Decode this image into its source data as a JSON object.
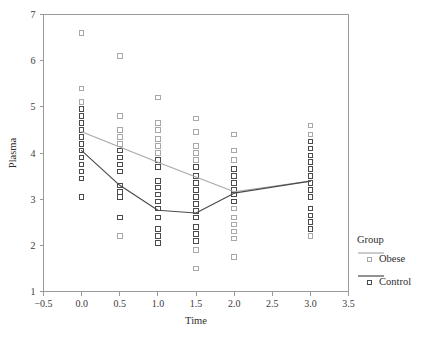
{
  "chart_data": {
    "type": "scatter",
    "title": "",
    "xlabel": "Time",
    "ylabel": "Plasma",
    "xlim": [
      -0.5,
      3.5
    ],
    "ylim": [
      1,
      7
    ],
    "xticks": [
      -0.5,
      0.0,
      0.5,
      1.0,
      1.5,
      2.0,
      2.5,
      3.0,
      3.5
    ],
    "xtick_labels": [
      "−0.5",
      "0.0",
      "0.5",
      "1.0",
      "1.5",
      "2.0",
      "2.5",
      "3.0",
      "3.5"
    ],
    "yticks": [
      1,
      2,
      3,
      4,
      5,
      6,
      7
    ],
    "ytick_labels": [
      "1",
      "2",
      "3",
      "4",
      "5",
      "6",
      "7"
    ],
    "grid": false,
    "legend": {
      "title": "Group",
      "position": "right",
      "entries": [
        {
          "name": "Obese",
          "color": "#a8a8a8",
          "marker": "open-square"
        },
        {
          "name": "Control",
          "color": "#4a4a4a",
          "marker": "open-square"
        }
      ]
    },
    "series": [
      {
        "name": "Obese",
        "type": "line",
        "color": "#a8a8a8",
        "x": [
          0.0,
          0.5,
          1.0,
          1.5,
          2.0,
          3.0
        ],
        "values": [
          4.46,
          4.13,
          3.8,
          3.48,
          3.16,
          3.39
        ]
      },
      {
        "name": "Control",
        "type": "line",
        "color": "#4a4a4a",
        "x": [
          0.0,
          0.5,
          1.0,
          1.5,
          2.0,
          3.0
        ],
        "values": [
          4.05,
          3.3,
          2.76,
          2.7,
          3.13,
          3.39
        ]
      }
    ],
    "scatter_points": {
      "Obese": {
        "color": "#a8a8a8",
        "points": [
          [
            0.0,
            6.6
          ],
          [
            0.0,
            5.4
          ],
          [
            0.0,
            5.1
          ],
          [
            0.0,
            4.95
          ],
          [
            0.0,
            4.8
          ],
          [
            0.0,
            4.65
          ],
          [
            0.0,
            4.5
          ],
          [
            0.0,
            4.35
          ],
          [
            0.0,
            4.2
          ],
          [
            0.0,
            4.05
          ],
          [
            0.0,
            3.9
          ],
          [
            0.0,
            3.75
          ],
          [
            0.0,
            3.6
          ],
          [
            0.0,
            3.45
          ],
          [
            0.0,
            3.05
          ],
          [
            0.5,
            6.1
          ],
          [
            0.5,
            4.8
          ],
          [
            0.5,
            4.5
          ],
          [
            0.5,
            4.35
          ],
          [
            0.5,
            4.2
          ],
          [
            0.5,
            4.05
          ],
          [
            0.5,
            3.9
          ],
          [
            0.5,
            3.75
          ],
          [
            0.5,
            3.6
          ],
          [
            0.5,
            3.3
          ],
          [
            0.5,
            3.15
          ],
          [
            0.5,
            3.05
          ],
          [
            0.5,
            2.6
          ],
          [
            0.5,
            2.2
          ],
          [
            1.0,
            5.2
          ],
          [
            1.0,
            4.65
          ],
          [
            1.0,
            4.5
          ],
          [
            1.0,
            4.3
          ],
          [
            1.0,
            4.15
          ],
          [
            1.0,
            4.0
          ],
          [
            1.0,
            3.85
          ],
          [
            1.0,
            3.7
          ],
          [
            1.0,
            3.4
          ],
          [
            1.0,
            3.25
          ],
          [
            1.0,
            3.1
          ],
          [
            1.0,
            2.95
          ],
          [
            1.0,
            2.8
          ],
          [
            1.0,
            2.6
          ],
          [
            1.0,
            2.35
          ],
          [
            1.0,
            2.2
          ],
          [
            1.0,
            2.05
          ],
          [
            1.5,
            4.75
          ],
          [
            1.5,
            4.45
          ],
          [
            1.5,
            4.15
          ],
          [
            1.5,
            4.0
          ],
          [
            1.5,
            3.85
          ],
          [
            1.5,
            3.7
          ],
          [
            1.5,
            3.5
          ],
          [
            1.5,
            3.35
          ],
          [
            1.5,
            3.2
          ],
          [
            1.5,
            3.05
          ],
          [
            1.5,
            2.9
          ],
          [
            1.5,
            2.75
          ],
          [
            1.5,
            2.6
          ],
          [
            1.5,
            2.4
          ],
          [
            1.5,
            2.25
          ],
          [
            1.5,
            2.1
          ],
          [
            1.5,
            1.9
          ],
          [
            1.5,
            1.5
          ],
          [
            2.0,
            4.4
          ],
          [
            2.0,
            4.05
          ],
          [
            2.0,
            3.85
          ],
          [
            2.0,
            3.65
          ],
          [
            2.0,
            3.5
          ],
          [
            2.0,
            3.35
          ],
          [
            2.0,
            3.2
          ],
          [
            2.0,
            3.1
          ],
          [
            2.0,
            2.95
          ],
          [
            2.0,
            2.8
          ],
          [
            2.0,
            2.6
          ],
          [
            2.0,
            2.45
          ],
          [
            2.0,
            2.3
          ],
          [
            2.0,
            2.15
          ],
          [
            2.0,
            1.75
          ],
          [
            3.0,
            4.6
          ],
          [
            3.0,
            4.4
          ],
          [
            3.0,
            4.25
          ],
          [
            3.0,
            4.1
          ],
          [
            3.0,
            3.95
          ],
          [
            3.0,
            3.8
          ],
          [
            3.0,
            3.65
          ],
          [
            3.0,
            3.5
          ],
          [
            3.0,
            3.35
          ],
          [
            3.0,
            3.2
          ],
          [
            3.0,
            3.05
          ],
          [
            3.0,
            2.8
          ],
          [
            3.0,
            2.65
          ],
          [
            3.0,
            2.5
          ],
          [
            3.0,
            2.35
          ],
          [
            3.0,
            2.2
          ]
        ]
      },
      "Control": {
        "color": "#4a4a4a",
        "points": [
          [
            0.0,
            4.95
          ],
          [
            0.0,
            4.8
          ],
          [
            0.0,
            4.65
          ],
          [
            0.0,
            4.5
          ],
          [
            0.0,
            4.35
          ],
          [
            0.0,
            4.2
          ],
          [
            0.0,
            4.05
          ],
          [
            0.0,
            3.9
          ],
          [
            0.0,
            3.75
          ],
          [
            0.0,
            3.6
          ],
          [
            0.0,
            3.45
          ],
          [
            0.0,
            3.05
          ],
          [
            0.5,
            4.05
          ],
          [
            0.5,
            3.9
          ],
          [
            0.5,
            3.75
          ],
          [
            0.5,
            3.6
          ],
          [
            0.5,
            3.3
          ],
          [
            0.5,
            3.15
          ],
          [
            0.5,
            3.05
          ],
          [
            0.5,
            2.6
          ],
          [
            1.0,
            3.85
          ],
          [
            1.0,
            3.7
          ],
          [
            1.0,
            3.4
          ],
          [
            1.0,
            3.25
          ],
          [
            1.0,
            3.1
          ],
          [
            1.0,
            2.95
          ],
          [
            1.0,
            2.8
          ],
          [
            1.0,
            2.6
          ],
          [
            1.0,
            2.35
          ],
          [
            1.0,
            2.2
          ],
          [
            1.0,
            2.05
          ],
          [
            1.5,
            3.7
          ],
          [
            1.5,
            3.5
          ],
          [
            1.5,
            3.35
          ],
          [
            1.5,
            3.2
          ],
          [
            1.5,
            3.05
          ],
          [
            1.5,
            2.9
          ],
          [
            1.5,
            2.75
          ],
          [
            1.5,
            2.6
          ],
          [
            1.5,
            2.4
          ],
          [
            1.5,
            2.25
          ],
          [
            1.5,
            2.1
          ],
          [
            2.0,
            3.65
          ],
          [
            2.0,
            3.5
          ],
          [
            2.0,
            3.35
          ],
          [
            2.0,
            3.2
          ],
          [
            2.0,
            3.1
          ],
          [
            2.0,
            2.95
          ],
          [
            3.0,
            4.25
          ],
          [
            3.0,
            4.1
          ],
          [
            3.0,
            3.95
          ],
          [
            3.0,
            3.8
          ],
          [
            3.0,
            3.65
          ],
          [
            3.0,
            3.5
          ],
          [
            3.0,
            3.35
          ],
          [
            3.0,
            3.2
          ],
          [
            3.0,
            3.05
          ],
          [
            3.0,
            2.8
          ],
          [
            3.0,
            2.65
          ],
          [
            3.0,
            2.5
          ],
          [
            3.0,
            2.35
          ]
        ]
      }
    }
  }
}
